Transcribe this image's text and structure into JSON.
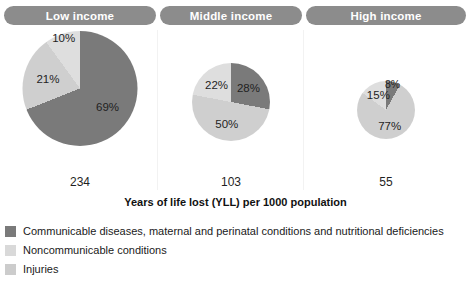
{
  "caption": "Years of life lost (YLL) per 1000 population",
  "colors": {
    "communicable": "#7a7a7a",
    "noncommunicable": "#cfcfcf",
    "injuries": "#dedede",
    "header_pill": "#8c8c8c",
    "header_text": "#ffffff",
    "divider": "#f2f2f2",
    "background": "#ffffff"
  },
  "panels": [
    {
      "header": "Low income",
      "total": "234",
      "labels": [
        "69%",
        "21%",
        "10%"
      ]
    },
    {
      "header": "Middle income",
      "total": "103",
      "labels": [
        "28%",
        "50%",
        "22%"
      ]
    },
    {
      "header": "High income",
      "total": "55",
      "labels": [
        "8%",
        "77%",
        "15%"
      ]
    }
  ],
  "legend": [
    {
      "label": "Communicable diseases, maternal and perinatal conditions and nutritional deficiencies",
      "color": "#7a7a7a"
    },
    {
      "label": "Noncommunicable conditions",
      "color": "#d9d9d9"
    },
    {
      "label": "Injuries",
      "color": "#cccccc"
    }
  ],
  "chart_data": {
    "type": "pie",
    "title": "Years of life lost (YLL) per 1000 population",
    "xlabel": "",
    "ylabel": "",
    "legend_position": "bottom-left",
    "grid": false,
    "value_unit": "years of life lost per 1000 population",
    "categories": [
      "Communicable diseases, maternal and perinatal conditions and nutritional deficiencies",
      "Noncommunicable conditions",
      "Injuries"
    ],
    "panels": [
      {
        "name": "Low income",
        "total": 234,
        "pie_diameter_px": 115,
        "slices": [
          {
            "category": "Communicable diseases, maternal and perinatal conditions and nutritional deficiencies",
            "percent": 69
          },
          {
            "category": "Noncommunicable conditions",
            "percent": 21
          },
          {
            "category": "Injuries",
            "percent": 10
          }
        ]
      },
      {
        "name": "Middle income",
        "total": 103,
        "pie_diameter_px": 78,
        "slices": [
          {
            "category": "Communicable diseases, maternal and perinatal conditions and nutritional deficiencies",
            "percent": 28
          },
          {
            "category": "Noncommunicable conditions",
            "percent": 50
          },
          {
            "category": "Injuries",
            "percent": 22
          }
        ]
      },
      {
        "name": "High income",
        "total": 55,
        "pie_diameter_px": 58,
        "slices": [
          {
            "category": "Communicable diseases, maternal and perinatal conditions and nutritional deficiencies",
            "percent": 8
          },
          {
            "category": "Noncommunicable conditions",
            "percent": 77
          },
          {
            "category": "Injuries",
            "percent": 15
          }
        ]
      }
    ]
  }
}
